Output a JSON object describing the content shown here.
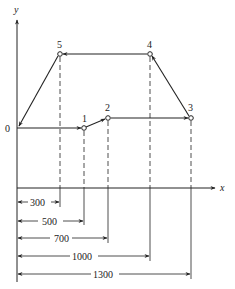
{
  "diagram": {
    "type": "tool-path-diagram",
    "axes": {
      "x_label": "x",
      "y_label": "y"
    },
    "points": [
      {
        "id": "0",
        "label": "0",
        "x": 17,
        "y": 128
      },
      {
        "id": "1",
        "label": "1",
        "x": 84,
        "y": 128
      },
      {
        "id": "2",
        "label": "2",
        "x": 108,
        "y": 118
      },
      {
        "id": "3",
        "label": "3",
        "x": 191,
        "y": 118
      },
      {
        "id": "4",
        "label": "4",
        "x": 150,
        "y": 54
      },
      {
        "id": "5",
        "label": "5",
        "x": 60,
        "y": 54
      }
    ],
    "path_order": [
      "0",
      "1",
      "2",
      "3",
      "4",
      "5",
      "0"
    ],
    "dimensions": [
      {
        "label": "300",
        "value": 300,
        "to_point": "5"
      },
      {
        "label": "500",
        "value": 500,
        "to_point": "1"
      },
      {
        "label": "700",
        "value": 700,
        "to_point": "2"
      },
      {
        "label": "1000",
        "value": 1000,
        "to_point": "4"
      },
      {
        "label": "1300",
        "value": 1300,
        "to_point": "3"
      }
    ],
    "colors": {
      "line": "#222222",
      "background": "#ffffff"
    }
  }
}
